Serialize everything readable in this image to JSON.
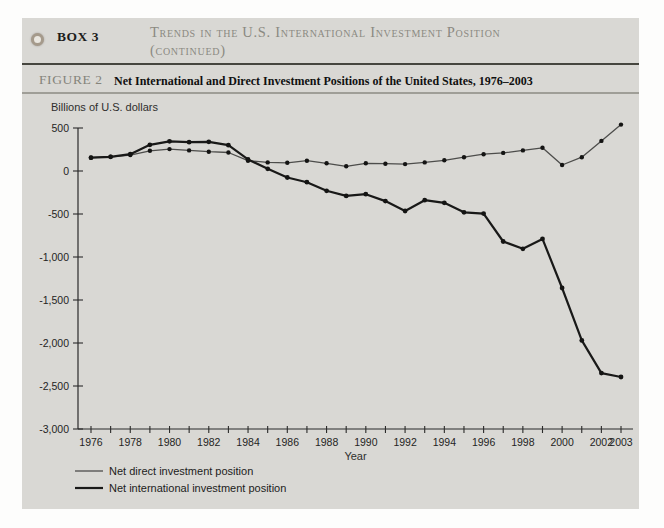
{
  "header": {
    "box_label": "BOX 3",
    "title_line1": "Trends in the U.S. International Investment Position",
    "title_line2": "(continued)"
  },
  "figure": {
    "label": "FIGURE 2",
    "title": "Net International and Direct Investment Positions of the United States, 1976–2003"
  },
  "chart_data": {
    "type": "line",
    "title": "Net International and Direct Investment Positions of the United States, 1976–2003",
    "ylabel": "Billions of U.S. dollars",
    "xlabel": "Year",
    "ylim": [
      -3000,
      500
    ],
    "grid": false,
    "legend_position": "bottom-left",
    "x": [
      1976,
      1977,
      1978,
      1979,
      1980,
      1981,
      1982,
      1983,
      1984,
      1985,
      1986,
      1987,
      1988,
      1989,
      1990,
      1991,
      1992,
      1993,
      1994,
      1995,
      1996,
      1997,
      1998,
      1999,
      2000,
      2001,
      2002,
      2003
    ],
    "series": [
      {
        "name": "Net direct investment position",
        "style": "thin",
        "color": "#4d4d4b",
        "values": [
          155,
          165,
          185,
          235,
          255,
          240,
          225,
          215,
          120,
          100,
          95,
          120,
          90,
          55,
          90,
          85,
          80,
          100,
          125,
          160,
          195,
          210,
          240,
          270,
          70,
          160,
          350,
          540
        ]
      },
      {
        "name": "Net international investment position",
        "style": "thick",
        "color": "#191918",
        "values": [
          155,
          165,
          195,
          305,
          345,
          335,
          340,
          300,
          135,
          25,
          -75,
          -130,
          -230,
          -290,
          -270,
          -350,
          -465,
          -340,
          -370,
          -480,
          -495,
          -820,
          -905,
          -790,
          -1360,
          -1970,
          -2350,
          -2395
        ]
      }
    ],
    "yticks": [
      {
        "value": 500,
        "label": "500"
      },
      {
        "value": 0,
        "label": "0"
      },
      {
        "value": -500,
        "label": "-500"
      },
      {
        "value": -1000,
        "label": "-1,000"
      },
      {
        "value": -1500,
        "label": "-1,500"
      },
      {
        "value": -2000,
        "label": "-2,000"
      },
      {
        "value": -2500,
        "label": "-2,500"
      },
      {
        "value": -3000,
        "label": "-3,000"
      }
    ],
    "xticks_labeled": [
      1976,
      1978,
      1980,
      1982,
      1984,
      1986,
      1988,
      1990,
      1992,
      1994,
      1996,
      1998,
      2000,
      2002,
      2003
    ]
  },
  "colors": {
    "box_bg": "#d9d8d4",
    "heading_text": "#8b8a82",
    "rule_dark": "#46463f",
    "rule_light": "#9f9e97",
    "axis": "#2b2b2a"
  }
}
